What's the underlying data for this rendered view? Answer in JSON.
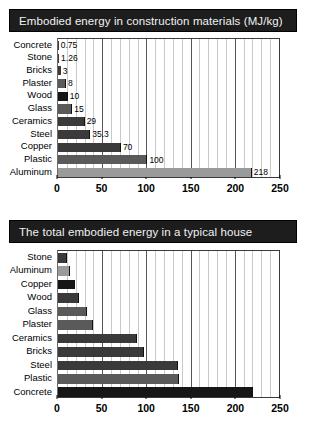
{
  "chart_data": [
    {
      "id": "construction-materials",
      "type": "bar",
      "orientation": "horizontal",
      "title": "Embodied energy in construction materials (MJ/kg)",
      "xlabel": "",
      "ylabel": "",
      "xlim": [
        0,
        250
      ],
      "xticks": [
        0,
        50,
        100,
        150,
        200,
        250
      ],
      "xticklabels": [
        "0",
        "50",
        "100",
        "150",
        "200",
        "250"
      ],
      "grid": true,
      "minor_grid_step": 10,
      "legend": "none",
      "categories": [
        "Concrete",
        "Stone",
        "Bricks",
        "Plaster",
        "Wood",
        "Glass",
        "Ceramics",
        "Steel",
        "Copper",
        "Plastic",
        "Aluminum"
      ],
      "values": [
        0.75,
        1.26,
        3,
        8,
        10,
        15,
        29,
        35.3,
        70,
        100,
        218
      ],
      "data_labels": [
        "0.75",
        "1.26",
        "3",
        "8",
        "10",
        "15",
        "29",
        "35.3",
        "70",
        "100",
        "218"
      ],
      "bar_shades": [
        "dark",
        "dark",
        "dark",
        "mid",
        "vdark",
        "mid",
        "dark",
        "dark",
        "dark",
        "mid",
        "light"
      ]
    },
    {
      "id": "typical-house",
      "type": "bar",
      "orientation": "horizontal",
      "title": "The total embodied energy in a typical house",
      "xlabel": "",
      "ylabel": "",
      "xlim": [
        0,
        250
      ],
      "xticks": [
        0,
        50,
        100,
        150,
        200,
        250
      ],
      "xticklabels": [
        "0",
        "50",
        "100",
        "150",
        "200",
        "250"
      ],
      "grid": true,
      "minor_grid_step": 10,
      "legend": "none",
      "categories": [
        "Stone",
        "Aluminum",
        "Copper",
        "Wood",
        "Glass",
        "Plaster",
        "Ceramics",
        "Bricks",
        "Steel",
        "Plastic",
        "Concrete"
      ],
      "values": [
        9,
        13,
        18,
        23,
        32,
        39,
        88,
        96,
        135,
        136,
        220
      ],
      "data_labels": [
        "",
        "",
        "",
        "",
        "",
        "",
        "",
        "",
        "",
        "",
        ""
      ],
      "bar_shades": [
        "dark",
        "light",
        "vdark",
        "dark",
        "mid",
        "mid",
        "dark",
        "dark",
        "dark",
        "mid",
        "vdark"
      ]
    }
  ],
  "panels": {
    "top": {
      "title": "Embodied energy in construction materials (MJ/kg)"
    },
    "bottom": {
      "title": "The total embodied energy in a typical house"
    }
  }
}
